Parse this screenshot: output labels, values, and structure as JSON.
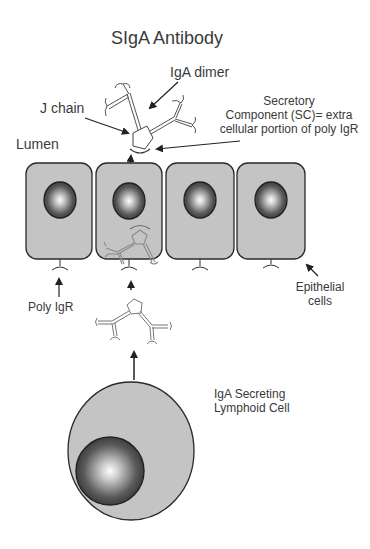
{
  "title": "SIgA Antibody",
  "labels": {
    "iga_dimer": "IgA dimer",
    "j_chain": "J chain",
    "secretory_component": [
      "Secretory",
      "Component (SC)= extra",
      "cellular portion of poly IgR"
    ],
    "lumen": "Lumen",
    "poly_igr": "Poly IgR",
    "epithelial_cells": [
      "Epithelial",
      "cells"
    ],
    "iga_secreting_cell": [
      "IgA Secreting",
      "Lymphoid Cell"
    ]
  },
  "colors": {
    "cell_fill": "#c4c4c4",
    "outline": "#2a2a2a",
    "text": "#3a3a3a",
    "antibody_stroke": "#7a7a7a"
  },
  "diagram": {
    "epithelial_cell_count": 4,
    "nodes": [
      "SIgA in lumen",
      "Epithelial cells",
      "Poly IgR",
      "IgA dimer",
      "IgA Secreting Lymphoid Cell"
    ],
    "flow": [
      "IgA Secreting Lymphoid Cell",
      "IgA dimer",
      "Poly IgR",
      "Epithelial cells",
      "Lumen (SIgA with Secretory Component)"
    ]
  }
}
